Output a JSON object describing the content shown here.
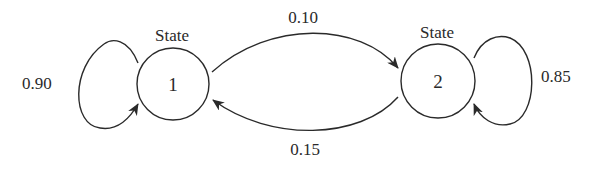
{
  "diagram": {
    "type": "markov-chain-state-transition",
    "nodes": [
      {
        "id": "1",
        "caption": "State",
        "label": "1"
      },
      {
        "id": "2",
        "caption": "State",
        "label": "2"
      }
    ],
    "edges": [
      {
        "from": "1",
        "to": "1",
        "probability": "0.90"
      },
      {
        "from": "1",
        "to": "2",
        "probability": "0.10"
      },
      {
        "from": "2",
        "to": "1",
        "probability": "0.15"
      },
      {
        "from": "2",
        "to": "2",
        "probability": "0.85"
      }
    ],
    "colors": {
      "stroke": "#2a2a2a",
      "background": "#ffffff"
    }
  }
}
